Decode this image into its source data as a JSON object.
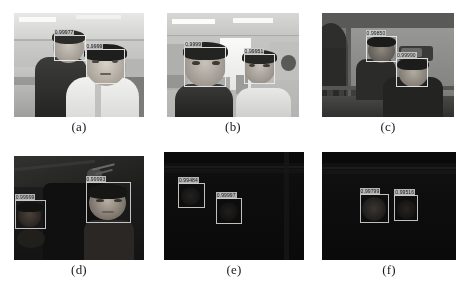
{
  "figure": {
    "kind": "face-detection-results-grid",
    "rows": 2,
    "cols": 3
  },
  "panels": [
    {
      "id": "a",
      "caption": "(a)",
      "scene": "bright-office-two-men",
      "lighting": "bright",
      "detections": [
        {
          "score": "0.99977",
          "x": 30.5,
          "y": 21.0,
          "w": 25.0,
          "h": 25.5
        },
        {
          "score": "0.9999",
          "x": 55.0,
          "y": 35.0,
          "w": 30.0,
          "h": 33.0
        }
      ]
    },
    {
      "id": "b",
      "caption": "(b)",
      "scene": "office-corridor-two-men",
      "lighting": "bright",
      "detections": [
        {
          "score": "0.9999",
          "x": 13.0,
          "y": 33.0,
          "w": 32.0,
          "h": 38.0
        },
        {
          "score": "0.99951",
          "x": 58.0,
          "y": 39.0,
          "w": 24.0,
          "h": 29.0
        }
      ]
    },
    {
      "id": "c",
      "caption": "(c)",
      "scene": "dim-indoor-two-men",
      "lighting": "dim",
      "detections": [
        {
          "score": "0.99850",
          "x": 33.0,
          "y": 22.5,
          "w": 24.0,
          "h": 25.0
        },
        {
          "score": "0.99990",
          "x": 56.0,
          "y": 43.0,
          "w": 24.0,
          "h": 28.0
        }
      ]
    },
    {
      "id": "d",
      "caption": "(d)",
      "scene": "low-light-indoor-two-faces",
      "lighting": "low",
      "detections": [
        {
          "score": "0.99999",
          "x": 0.5,
          "y": 42.0,
          "w": 24.0,
          "h": 28.0
        },
        {
          "score": "0.99993",
          "x": 55.0,
          "y": 25.0,
          "w": 35.0,
          "h": 39.0
        }
      ]
    },
    {
      "id": "e",
      "caption": "(e)",
      "scene": "near-dark-two-faces",
      "lighting": "near-dark",
      "detections": [
        {
          "score": "0.99484",
          "x": 10.0,
          "y": 29.0,
          "w": 19.0,
          "h": 23.0
        },
        {
          "score": "0.99997",
          "x": 37.0,
          "y": 43.0,
          "w": 19.0,
          "h": 24.0
        }
      ]
    },
    {
      "id": "f",
      "caption": "(f)",
      "scene": "near-dark-adjacent-faces",
      "lighting": "near-dark",
      "detections": [
        {
          "score": "0.99799",
          "x": 28.0,
          "y": 39.0,
          "w": 22.0,
          "h": 27.0
        },
        {
          "score": "0.99516",
          "x": 54.0,
          "y": 40.0,
          "w": 18.0,
          "h": 24.0
        }
      ]
    }
  ],
  "colors": {
    "box_stroke": "#ebebeb",
    "label_bg": "#cdcdcd",
    "label_text": "#151515",
    "page_bg": "#ffffff",
    "caption_text": "#1a1a1a"
  }
}
